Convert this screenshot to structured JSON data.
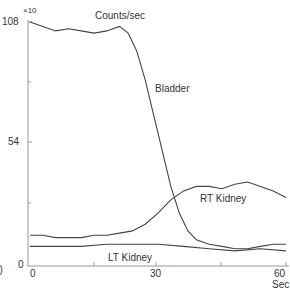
{
  "chart_data": {
    "type": "line",
    "title": "Counts/sec",
    "panel_label": "b)",
    "xlabel": "Sec",
    "ylabel": "Counts/sec",
    "y_multiplier": "×10",
    "xlim": [
      0,
      60
    ],
    "ylim": [
      0,
      108
    ],
    "x_ticks": [
      0,
      30,
      60
    ],
    "y_ticks": [
      0,
      54,
      108
    ],
    "series": [
      {
        "name": "Bladder",
        "x": [
          0,
          3,
          6,
          9,
          12,
          15,
          18,
          21,
          23,
          25,
          27,
          29,
          31,
          33,
          35,
          37,
          39,
          42,
          45,
          48,
          51,
          54,
          57,
          60
        ],
        "y": [
          108,
          106,
          104,
          105,
          104,
          103,
          104,
          106,
          103,
          95,
          82,
          66,
          50,
          34,
          22,
          14,
          10,
          8,
          7,
          6,
          6,
          7,
          8,
          8
        ]
      },
      {
        "name": "RT Kidney",
        "x": [
          0,
          3,
          6,
          9,
          12,
          15,
          18,
          21,
          24,
          27,
          30,
          33,
          36,
          39,
          42,
          45,
          48,
          51,
          54,
          57,
          60
        ],
        "y": [
          12,
          12,
          11,
          11,
          11,
          12,
          12,
          13,
          14,
          17,
          22,
          28,
          32,
          34,
          34,
          33,
          35,
          36,
          34,
          32,
          29
        ]
      },
      {
        "name": "LT Kidney",
        "x": [
          0,
          6,
          12,
          18,
          24,
          30,
          36,
          42,
          48,
          54,
          60
        ],
        "y": [
          7,
          7,
          7,
          8,
          8,
          8,
          7,
          6,
          5,
          6,
          5
        ]
      }
    ],
    "annotations": [
      "Bladder",
      "RT Kidney",
      "LT Kidney"
    ],
    "grid": false
  },
  "labels": {
    "y_mult": "×10",
    "y_top": "108",
    "y_mid": "54",
    "y_zero": "0",
    "title": "Counts/sec",
    "bladder": "Bladder",
    "rt": "RT Kidney",
    "lt": "LT Kidney",
    "x0": "0",
    "x30": "30",
    "x60": "60",
    "xunit": "Sec",
    "panel": "b)"
  }
}
